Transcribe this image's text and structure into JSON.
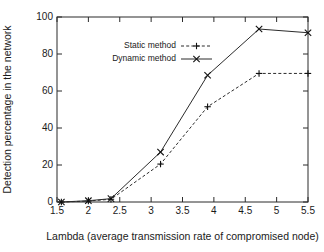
{
  "chart_data": {
    "type": "line",
    "title": "",
    "xlabel": "Lambda (average transmission rate of compromised node)",
    "ylabel": "Detection percentage in the network",
    "xlim": [
      1.5,
      5.5
    ],
    "ylim": [
      0,
      100
    ],
    "xticks": [
      "1.5",
      "2",
      "2.5",
      "3",
      "3.5",
      "4",
      "4.5",
      "5",
      "5.5"
    ],
    "xtick_values": [
      1.5,
      2,
      2.5,
      3,
      3.5,
      4,
      4.5,
      5,
      5.5
    ],
    "yticks": [
      "0",
      "20",
      "40",
      "60",
      "80",
      "100"
    ],
    "ytick_values": [
      0,
      20,
      40,
      60,
      80,
      100
    ],
    "grid": false,
    "legend_position": "upper-left-inside",
    "x": [
      1.57,
      2.0,
      2.36,
      3.15,
      3.9,
      4.72,
      5.5
    ],
    "series": [
      {
        "name": "Static method",
        "marker": "plus",
        "linestyle": "dashed",
        "color": "#2b2b2b",
        "values": [
          0,
          0.5,
          1.5,
          20.5,
          51.5,
          69.5,
          69.5
        ]
      },
      {
        "name": "Dynamic method",
        "marker": "cross",
        "linestyle": "solid",
        "color": "#2b2b2b",
        "values": [
          0,
          0.7,
          1.8,
          27,
          68.5,
          93.5,
          91.5
        ]
      }
    ],
    "legend": [
      {
        "label": "Static method",
        "marker": "plus",
        "linestyle": "dashed"
      },
      {
        "label": "Dynamic method",
        "marker": "cross",
        "linestyle": "solid"
      }
    ]
  }
}
